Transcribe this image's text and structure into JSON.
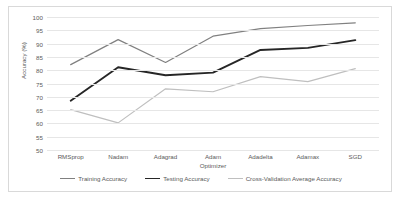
{
  "chart_data": {
    "type": "line",
    "title": "",
    "xlabel": "Optimizer",
    "ylabel": "Accuracy (%)",
    "categories": [
      "RMSprop",
      "Nadam",
      "Adagrad",
      "Adam",
      "Adadelta",
      "Adamax",
      "SGD"
    ],
    "ylim": [
      50,
      100
    ],
    "yticks": [
      50,
      55,
      60,
      65,
      70,
      75,
      80,
      85,
      90,
      95,
      100
    ],
    "grid": true,
    "legend_position": "bottom",
    "series": [
      {
        "name": "Training Accuracy",
        "color": "#808080",
        "values": [
          82.1,
          91.5,
          82.9,
          92.8,
          95.6,
          96.8,
          97.8
        ]
      },
      {
        "name": "Testing Accuracy",
        "color": "#262626",
        "values": [
          68.5,
          81.1,
          78.1,
          79.1,
          87.6,
          88.4,
          91.3
        ]
      },
      {
        "name": "Cross-Validation Average Accuracy",
        "color": "#bfbfbf",
        "values": [
          65.2,
          60.2,
          73.0,
          71.9,
          77.6,
          75.7,
          80.6
        ]
      }
    ]
  }
}
